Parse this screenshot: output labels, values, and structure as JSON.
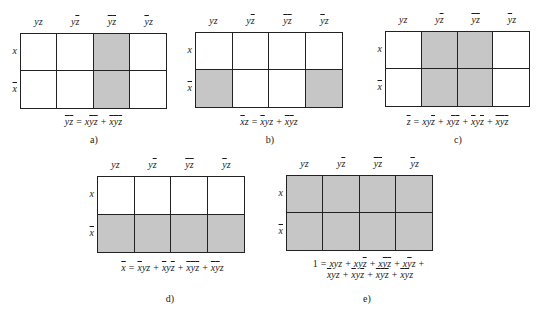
{
  "column_headers": [
    [
      {
        "v": "y",
        "n": false
      },
      {
        "v": "z",
        "n": false
      }
    ],
    [
      {
        "v": "y",
        "n": false
      },
      {
        "v": "z",
        "n": true
      }
    ],
    [
      {
        "v": "y",
        "n": true
      },
      {
        "v": "z",
        "n": true
      }
    ],
    [
      {
        "v": "y",
        "n": true
      },
      {
        "v": "z",
        "n": false
      }
    ]
  ],
  "row_headers": [
    {
      "v": "x",
      "n": false
    },
    {
      "v": "x",
      "n": true
    }
  ],
  "colors": {
    "shaded": "#c6c6c6",
    "line": "#222222",
    "background": "#ffffff"
  },
  "maps": [
    {
      "id": "a",
      "caption": "a)",
      "box": {
        "left": 20,
        "top": 33,
        "width": 147,
        "height": 76
      },
      "shaded": [
        [
          0,
          0,
          1,
          0
        ],
        [
          0,
          0,
          1,
          0
        ]
      ],
      "formula_lines": [
        [
          {
            "term": [
              {
                "v": "y",
                "n": true
              },
              {
                "v": "z",
                "n": true
              }
            ],
            "group_bar": true
          },
          {
            "op": "="
          },
          {
            "term": [
              {
                "v": "x",
                "n": false
              },
              {
                "v": "y",
                "n": true
              },
              {
                "v": "z",
                "n": true
              }
            ]
          },
          {
            "op": "+"
          },
          {
            "term": [
              {
                "v": "x",
                "n": true
              },
              {
                "v": "y",
                "n": true
              },
              {
                "v": "z",
                "n": true
              }
            ]
          }
        ]
      ],
      "formula_text": [
        "y̅z̅ = xy̅z̅ + x̅y̅z̅"
      ],
      "formula_pos": {
        "left": 20,
        "top": 116,
        "width": 147
      },
      "caption_pos": {
        "left": 79,
        "top": 134
      }
    },
    {
      "id": "b",
      "caption": "b)",
      "box": {
        "left": 195,
        "top": 32,
        "width": 148,
        "height": 76
      },
      "shaded": [
        [
          0,
          0,
          0,
          0
        ],
        [
          1,
          0,
          0,
          1
        ]
      ],
      "formula_lines": [
        [
          {
            "term": [
              {
                "v": "x",
                "n": true
              },
              {
                "v": "z",
                "n": false
              }
            ]
          },
          {
            "op": "="
          },
          {
            "term": [
              {
                "v": "x",
                "n": true
              },
              {
                "v": "y",
                "n": false
              },
              {
                "v": "z",
                "n": false
              }
            ]
          },
          {
            "op": "+"
          },
          {
            "term": [
              {
                "v": "x",
                "n": true
              },
              {
                "v": "y",
                "n": true
              },
              {
                "v": "z",
                "n": false
              }
            ]
          }
        ]
      ],
      "formula_text": [
        "x̅z = x̅yz + x̅y̅z"
      ],
      "formula_pos": {
        "left": 195,
        "top": 116,
        "width": 148
      },
      "caption_pos": {
        "left": 255,
        "top": 134
      }
    },
    {
      "id": "c",
      "caption": "c)",
      "box": {
        "left": 385,
        "top": 31,
        "width": 145,
        "height": 76
      },
      "shaded": [
        [
          0,
          1,
          1,
          0
        ],
        [
          0,
          1,
          1,
          0
        ]
      ],
      "formula_lines": [
        [
          {
            "term": [
              {
                "v": "z",
                "n": true
              }
            ]
          },
          {
            "op": "="
          },
          {
            "term": [
              {
                "v": "x",
                "n": false
              },
              {
                "v": "y",
                "n": false
              },
              {
                "v": "z",
                "n": true
              }
            ]
          },
          {
            "op": "+"
          },
          {
            "term": [
              {
                "v": "x",
                "n": false
              },
              {
                "v": "y",
                "n": true
              },
              {
                "v": "z",
                "n": true
              }
            ]
          },
          {
            "op": "+"
          },
          {
            "term": [
              {
                "v": "x",
                "n": true
              },
              {
                "v": "y",
                "n": false
              },
              {
                "v": "z",
                "n": true
              }
            ]
          },
          {
            "op": "+"
          },
          {
            "term": [
              {
                "v": "x",
                "n": true
              },
              {
                "v": "y",
                "n": true
              },
              {
                "v": "z",
                "n": true
              }
            ]
          }
        ]
      ],
      "formula_text": [
        "z̅ = xyz̅ + xy̅z̅ + x̅yz̅ + x̅y̅z̅"
      ],
      "formula_pos": {
        "left": 370,
        "top": 116,
        "width": 175
      },
      "caption_pos": {
        "left": 443,
        "top": 134
      }
    },
    {
      "id": "d",
      "caption": "d)",
      "box": {
        "left": 97,
        "top": 176,
        "width": 148,
        "height": 77
      },
      "shaded": [
        [
          0,
          0,
          0,
          0
        ],
        [
          1,
          1,
          1,
          1
        ]
      ],
      "formula_lines": [
        [
          {
            "term": [
              {
                "v": "x",
                "n": true
              }
            ]
          },
          {
            "op": "="
          },
          {
            "term": [
              {
                "v": "x",
                "n": true
              },
              {
                "v": "y",
                "n": false
              },
              {
                "v": "z",
                "n": false
              }
            ]
          },
          {
            "op": "+"
          },
          {
            "term": [
              {
                "v": "x",
                "n": true
              },
              {
                "v": "y",
                "n": false
              },
              {
                "v": "z",
                "n": true
              }
            ]
          },
          {
            "op": "+"
          },
          {
            "term": [
              {
                "v": "x",
                "n": true
              },
              {
                "v": "y",
                "n": true
              },
              {
                "v": "z",
                "n": true
              }
            ]
          },
          {
            "op": "+"
          },
          {
            "term": [
              {
                "v": "x",
                "n": true
              },
              {
                "v": "y",
                "n": true
              },
              {
                "v": "z",
                "n": false
              }
            ]
          }
        ]
      ],
      "formula_text": [
        "x̅ = x̅yz + x̅yz̅ + x̅y̅z̅ + x̅y̅z"
      ],
      "formula_pos": {
        "left": 85,
        "top": 262,
        "width": 175
      },
      "caption_pos": {
        "left": 155,
        "top": 293
      }
    },
    {
      "id": "e",
      "caption": "e)",
      "box": {
        "left": 286,
        "top": 175,
        "width": 147,
        "height": 76
      },
      "shaded": [
        [
          1,
          1,
          1,
          1
        ],
        [
          1,
          1,
          1,
          1
        ]
      ],
      "formula_lines": [
        [
          {
            "const": "1"
          },
          {
            "op": "="
          },
          {
            "term": [
              {
                "v": "x",
                "n": false
              },
              {
                "v": "y",
                "n": false
              },
              {
                "v": "z",
                "n": false
              }
            ]
          },
          {
            "op": "+"
          },
          {
            "term": [
              {
                "v": "x",
                "n": false
              },
              {
                "v": "y",
                "n": false
              },
              {
                "v": "z",
                "n": true
              }
            ]
          },
          {
            "op": "+"
          },
          {
            "term": [
              {
                "v": "x",
                "n": false
              },
              {
                "v": "y",
                "n": true
              },
              {
                "v": "z",
                "n": true
              }
            ]
          },
          {
            "op": "+"
          },
          {
            "term": [
              {
                "v": "x",
                "n": false
              },
              {
                "v": "y",
                "n": true
              },
              {
                "v": "z",
                "n": false
              }
            ]
          },
          {
            "op": "+"
          }
        ],
        [
          {
            "term": [
              {
                "v": "x",
                "n": true
              },
              {
                "v": "y",
                "n": false
              },
              {
                "v": "z",
                "n": false
              }
            ]
          },
          {
            "op": "+"
          },
          {
            "term": [
              {
                "v": "x",
                "n": true
              },
              {
                "v": "y",
                "n": false
              },
              {
                "v": "z",
                "n": true
              }
            ]
          },
          {
            "op": "+"
          },
          {
            "term": [
              {
                "v": "x",
                "n": true
              },
              {
                "v": "y",
                "n": true
              },
              {
                "v": "z",
                "n": true
              }
            ]
          },
          {
            "op": "+"
          },
          {
            "term": [
              {
                "v": "x",
                "n": true
              },
              {
                "v": "y",
                "n": true
              },
              {
                "v": "z",
                "n": false
              }
            ]
          }
        ]
      ],
      "formula_text": [
        "1 = xyz + xyz̅ + xy̅z̅ + xy̅z +",
        "x̅yz + x̅yz̅ + x̅y̅z̅ + x̅y̅z"
      ],
      "formula_pos": {
        "left": 290,
        "top": 258,
        "width": 160
      },
      "caption_pos": {
        "left": 352,
        "top": 293
      }
    }
  ]
}
